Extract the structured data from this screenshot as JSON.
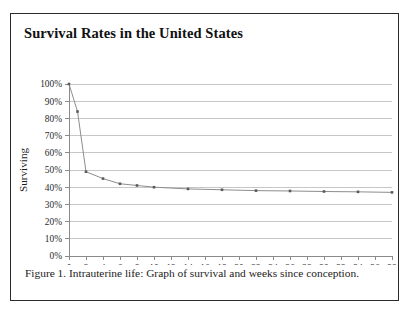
{
  "figure": {
    "title": "Survival Rates in the United States",
    "caption": "Figure 1. Intrauterine life: Graph of survival and weeks since conception."
  },
  "chart_data": {
    "type": "line",
    "title": "Survival Rates in the United States",
    "xlabel": "",
    "ylabel": "Surviving",
    "xlim": [
      0,
      38
    ],
    "ylim": [
      0,
      100
    ],
    "grid": "horizontal",
    "legend": "none",
    "x_tick_labels": [
      "0",
      "2",
      "4",
      "6",
      "8",
      "10",
      "12",
      "14",
      "16",
      "18",
      "20",
      "22",
      "24",
      "26",
      "28",
      "30",
      "32",
      "34",
      "36",
      "38"
    ],
    "x_ticks": [
      0,
      2,
      4,
      6,
      8,
      10,
      12,
      14,
      16,
      18,
      20,
      22,
      24,
      26,
      28,
      30,
      32,
      34,
      36,
      38
    ],
    "y_tick_labels": [
      "0%",
      "10%",
      "20%",
      "30%",
      "40%",
      "50%",
      "60%",
      "70%",
      "80%",
      "90%",
      "100%"
    ],
    "y_ticks": [
      0,
      10,
      20,
      30,
      40,
      50,
      60,
      70,
      80,
      90,
      100
    ],
    "series": [
      {
        "name": "Surviving",
        "x": [
          0,
          1,
          2,
          4,
          6,
          8,
          10,
          14,
          18,
          22,
          26,
          30,
          34,
          38
        ],
        "values": [
          100,
          84,
          49,
          45,
          42,
          41,
          40,
          39,
          38.5,
          38,
          37.8,
          37.5,
          37.3,
          37
        ]
      }
    ]
  }
}
